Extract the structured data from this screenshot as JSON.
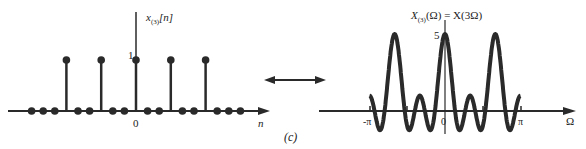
{
  "left_plot": {
    "ylabel": "x",
    "ylabel_sub": "(3)",
    "ylabel_arg": "[n]",
    "y_tick": "1",
    "x_origin": "0",
    "xlabel": "n",
    "stems_n": [
      -6,
      -3,
      0,
      3,
      6
    ],
    "zeros_n": [
      -9,
      -8,
      -7,
      -5,
      -4,
      -2,
      -1,
      1,
      2,
      4,
      5,
      7,
      8,
      9
    ]
  },
  "panel_label": "(c)",
  "right_plot": {
    "title_lhs": "X",
    "title_sub": "(3)",
    "title_rest": "(Ω) = X(3Ω)",
    "peak_label": "5",
    "x_ticks": [
      "-π",
      "0",
      "π"
    ],
    "xlabel": "Ω"
  },
  "colors": {
    "ink": "#2a2a2a"
  }
}
